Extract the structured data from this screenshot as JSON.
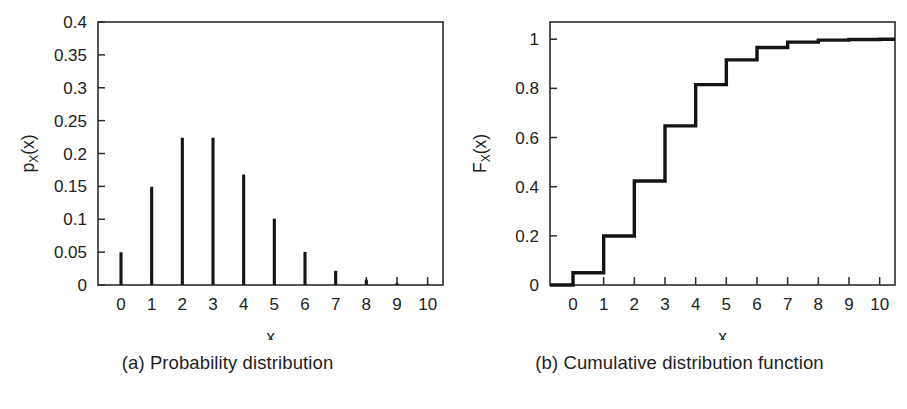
{
  "figure": {
    "background_color": "#ffffff",
    "line_color": "#141414",
    "axis_color": "#2b2b2b"
  },
  "panel_a": {
    "caption": "(a) Probability distribution",
    "xlabel": "x",
    "ylabel_main": "p",
    "ylabel_sub": "X",
    "ylabel_arg": "(x)"
  },
  "panel_b": {
    "caption": "(b) Cumulative distribution function",
    "xlabel": "x",
    "ylabel_main": "F",
    "ylabel_sub": "X",
    "ylabel_arg": "(x)"
  },
  "chart_data": [
    {
      "type": "bar",
      "id": "probability-distribution",
      "title": "(a) Probability distribution",
      "xlabel": "x",
      "ylabel": "p_X(x)",
      "categories": [
        "0",
        "1",
        "2",
        "3",
        "4",
        "5",
        "6",
        "7",
        "8",
        "9",
        "10"
      ],
      "x": [
        0,
        1,
        2,
        3,
        4,
        5,
        6,
        7,
        8,
        9,
        10
      ],
      "values": [
        0.0498,
        0.1494,
        0.224,
        0.224,
        0.168,
        0.1008,
        0.0504,
        0.0216,
        0.0081,
        0.0027,
        0.0008
      ],
      "xlim": [
        -0.75,
        10.5
      ],
      "ylim": [
        0,
        0.4
      ],
      "xticks": [
        0,
        1,
        2,
        3,
        4,
        5,
        6,
        7,
        8,
        9,
        10
      ],
      "xticklabels": [
        "0",
        "1",
        "2",
        "3",
        "4",
        "5",
        "6",
        "7",
        "8",
        "9",
        "10"
      ],
      "yticks": [
        0,
        0.05,
        0.1,
        0.15,
        0.2,
        0.25,
        0.3,
        0.35,
        0.4
      ],
      "yticklabels": [
        "0",
        "0.05",
        "0.1",
        "0.15",
        "0.2",
        "0.25",
        "0.3",
        "0.35",
        "0.4"
      ],
      "grid": false,
      "legend": "none",
      "style": "stem-lines"
    },
    {
      "type": "line",
      "id": "cumulative-distribution-function",
      "title": "(b) Cumulative distribution function",
      "xlabel": "x",
      "ylabel": "F_X(x)",
      "x": [
        0,
        1,
        2,
        3,
        4,
        5,
        6,
        7,
        8,
        9,
        10
      ],
      "values": [
        0.0498,
        0.1991,
        0.4232,
        0.6472,
        0.8153,
        0.9161,
        0.9665,
        0.9881,
        0.9962,
        0.9989,
        0.9997
      ],
      "xlim": [
        -0.75,
        10.5
      ],
      "ylim": [
        0,
        1.07
      ],
      "xticks": [
        0,
        1,
        2,
        3,
        4,
        5,
        6,
        7,
        8,
        9,
        10
      ],
      "xticklabels": [
        "0",
        "1",
        "2",
        "3",
        "4",
        "5",
        "6",
        "7",
        "8",
        "9",
        "10"
      ],
      "yticks": [
        0,
        0.2,
        0.4,
        0.6,
        0.8,
        1
      ],
      "yticklabels": [
        "0",
        "0.2",
        "0.4",
        "0.6",
        "0.8",
        "1"
      ],
      "grid": false,
      "legend": "none",
      "style": "step-post"
    }
  ]
}
